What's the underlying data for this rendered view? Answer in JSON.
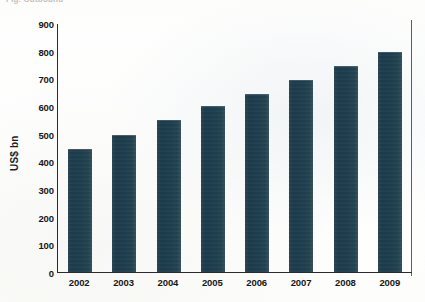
{
  "page": {
    "cropped_header_text": "Fig. Outbound"
  },
  "chart_data": {
    "type": "bar",
    "title": "",
    "subtitle": "",
    "xlabel": "",
    "ylabel": "US$ bn",
    "categories": [
      "2002",
      "2003",
      "2004",
      "2005",
      "2006",
      "2007",
      "2008",
      "2009"
    ],
    "values": [
      445,
      497,
      550,
      600,
      645,
      695,
      745,
      795
    ],
    "series": [
      {
        "name": "US$ bn",
        "values": [
          445,
          497,
          550,
          600,
          645,
          695,
          745,
          795
        ]
      }
    ],
    "ylim": [
      0,
      900
    ],
    "ytick_values": [
      0,
      100,
      200,
      300,
      400,
      500,
      600,
      700,
      800,
      900
    ],
    "ytick_labels": [
      "0",
      "100",
      "200",
      "300",
      "400",
      "500",
      "600",
      "700",
      "800",
      "900"
    ],
    "grid": false,
    "legend": false,
    "legend_position": "none",
    "bar_color": "#1e3d4e",
    "axis_color": "#2b2b2b",
    "background_color": "#ffffff"
  }
}
